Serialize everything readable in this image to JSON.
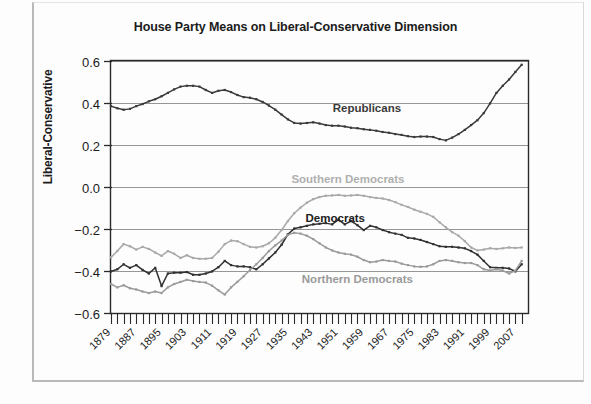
{
  "chart_data": {
    "type": "line",
    "title": "House Party Means on Liberal-Conservative Dimension",
    "xlabel": "",
    "ylabel": "Liberal-Conservative",
    "ylim": [
      -0.6,
      0.6
    ],
    "xlim": [
      1879,
      2011
    ],
    "grid": true,
    "legend_position": "inline-annotations",
    "ytick_labels": [
      "0.6",
      "0.4",
      "0.2",
      "0.0",
      "-0.2",
      "-0.4",
      "-0.6"
    ],
    "ytick_values": [
      0.6,
      0.4,
      0.2,
      0.0,
      -0.2,
      -0.4,
      -0.6
    ],
    "xtick_labels": [
      "1879",
      "1887",
      "1895",
      "1903",
      "1911",
      "1919",
      "1927",
      "1935",
      "1943",
      "1951",
      "1959",
      "1967",
      "1975",
      "1983",
      "1991",
      "1999",
      "2007"
    ],
    "xtick_values": [
      1879,
      1887,
      1895,
      1903,
      1911,
      1919,
      1927,
      1935,
      1943,
      1951,
      1959,
      1967,
      1975,
      1983,
      1991,
      1999,
      2007
    ],
    "x": [
      1879,
      1881,
      1883,
      1885,
      1887,
      1889,
      1891,
      1893,
      1895,
      1897,
      1899,
      1901,
      1903,
      1905,
      1907,
      1909,
      1911,
      1913,
      1915,
      1917,
      1919,
      1921,
      1923,
      1925,
      1927,
      1929,
      1931,
      1933,
      1935,
      1937,
      1939,
      1941,
      1943,
      1945,
      1947,
      1949,
      1951,
      1953,
      1955,
      1957,
      1959,
      1961,
      1963,
      1965,
      1967,
      1969,
      1971,
      1973,
      1975,
      1977,
      1979,
      1981,
      1983,
      1985,
      1987,
      1989,
      1991,
      1993,
      1995,
      1997,
      1999,
      2001,
      2003,
      2005,
      2007,
      2009
    ],
    "series": [
      {
        "name": "Republicans",
        "color": "#3a3a3a",
        "values": [
          0.385,
          0.375,
          0.368,
          0.372,
          0.385,
          0.395,
          0.408,
          0.418,
          0.432,
          0.448,
          0.465,
          0.478,
          0.482,
          0.482,
          0.478,
          0.462,
          0.448,
          0.458,
          0.462,
          0.452,
          0.438,
          0.428,
          0.425,
          0.418,
          0.405,
          0.388,
          0.368,
          0.345,
          0.322,
          0.305,
          0.302,
          0.305,
          0.308,
          0.302,
          0.295,
          0.292,
          0.292,
          0.288,
          0.282,
          0.28,
          0.275,
          0.272,
          0.268,
          0.262,
          0.258,
          0.252,
          0.248,
          0.242,
          0.238,
          0.24,
          0.24,
          0.238,
          0.228,
          0.222,
          0.235,
          0.252,
          0.272,
          0.295,
          0.318,
          0.352,
          0.398,
          0.448,
          0.482,
          0.512,
          0.548,
          0.582
        ]
      },
      {
        "name": "Southern Democrats",
        "color": "#a8a8a8",
        "values": [
          -0.335,
          -0.305,
          -0.272,
          -0.282,
          -0.298,
          -0.285,
          -0.295,
          -0.312,
          -0.328,
          -0.305,
          -0.318,
          -0.338,
          -0.325,
          -0.338,
          -0.342,
          -0.342,
          -0.338,
          -0.308,
          -0.272,
          -0.255,
          -0.258,
          -0.272,
          -0.285,
          -0.288,
          -0.282,
          -0.268,
          -0.242,
          -0.205,
          -0.162,
          -0.125,
          -0.098,
          -0.075,
          -0.058,
          -0.048,
          -0.042,
          -0.04,
          -0.038,
          -0.042,
          -0.04,
          -0.038,
          -0.042,
          -0.048,
          -0.052,
          -0.055,
          -0.062,
          -0.072,
          -0.085,
          -0.095,
          -0.108,
          -0.118,
          -0.128,
          -0.142,
          -0.168,
          -0.192,
          -0.215,
          -0.232,
          -0.258,
          -0.288,
          -0.302,
          -0.298,
          -0.292,
          -0.295,
          -0.292,
          -0.288,
          -0.29,
          -0.288
        ]
      },
      {
        "name": "Democrats",
        "color": "#303030",
        "values": [
          -0.402,
          -0.392,
          -0.368,
          -0.385,
          -0.372,
          -0.395,
          -0.412,
          -0.385,
          -0.472,
          -0.412,
          -0.408,
          -0.408,
          -0.405,
          -0.418,
          -0.418,
          -0.412,
          -0.402,
          -0.382,
          -0.352,
          -0.372,
          -0.378,
          -0.378,
          -0.382,
          -0.392,
          -0.368,
          -0.34,
          -0.312,
          -0.275,
          -0.225,
          -0.198,
          -0.192,
          -0.185,
          -0.178,
          -0.175,
          -0.172,
          -0.178,
          -0.155,
          -0.178,
          -0.162,
          -0.182,
          -0.205,
          -0.185,
          -0.192,
          -0.205,
          -0.215,
          -0.222,
          -0.228,
          -0.242,
          -0.245,
          -0.252,
          -0.262,
          -0.272,
          -0.282,
          -0.285,
          -0.285,
          -0.288,
          -0.292,
          -0.305,
          -0.322,
          -0.352,
          -0.382,
          -0.385,
          -0.385,
          -0.388,
          -0.402,
          -0.368
        ]
      },
      {
        "name": "Northern Democrats",
        "color": "#9a9a9a",
        "values": [
          -0.462,
          -0.478,
          -0.468,
          -0.482,
          -0.488,
          -0.498,
          -0.505,
          -0.498,
          -0.505,
          -0.478,
          -0.462,
          -0.452,
          -0.442,
          -0.448,
          -0.452,
          -0.455,
          -0.47,
          -0.492,
          -0.512,
          -0.478,
          -0.452,
          -0.425,
          -0.395,
          -0.368,
          -0.338,
          -0.305,
          -0.278,
          -0.255,
          -0.228,
          -0.218,
          -0.222,
          -0.232,
          -0.248,
          -0.268,
          -0.288,
          -0.302,
          -0.312,
          -0.318,
          -0.322,
          -0.332,
          -0.348,
          -0.358,
          -0.355,
          -0.348,
          -0.352,
          -0.355,
          -0.365,
          -0.372,
          -0.378,
          -0.38,
          -0.378,
          -0.368,
          -0.352,
          -0.348,
          -0.352,
          -0.358,
          -0.362,
          -0.362,
          -0.372,
          -0.392,
          -0.398,
          -0.392,
          -0.398,
          -0.412,
          -0.398,
          -0.352
        ]
      }
    ],
    "annotations": [
      {
        "text": "Republicans",
        "x": 1960,
        "y": 0.355,
        "color": "#3a3a3a"
      },
      {
        "text": "Southern Democrats",
        "x": 1954,
        "y": 0.02,
        "color": "#b0b0b0"
      },
      {
        "text": "Democrats",
        "x": 1950,
        "y": -0.165,
        "color": "#202020"
      },
      {
        "text": "Northern Democrats",
        "x": 1957,
        "y": -0.455,
        "color": "#9a9a9a"
      }
    ]
  }
}
